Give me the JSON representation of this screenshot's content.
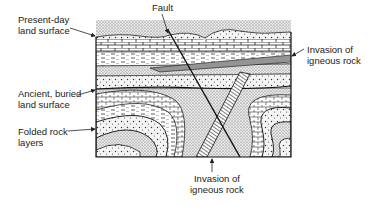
{
  "diagram": {
    "type": "geological cross-section",
    "labels": {
      "fault": "Fault",
      "present_day_surface": {
        "line1": "Present-day",
        "line2": "land surface"
      },
      "ancient_surface": {
        "line1": "Ancient, buried",
        "line2": "land surface"
      },
      "folded_layers": {
        "line1": "Folded rock",
        "line2": "layers"
      },
      "igneous_right": {
        "line1": "Invasion of",
        "line2": "igneous rock"
      },
      "igneous_bottom": {
        "line1": "Invasion of",
        "line2": "igneous rock"
      }
    },
    "colors": {
      "ink": "#1a1a1a",
      "background": "#ffffff",
      "stipple": "#555555"
    }
  }
}
